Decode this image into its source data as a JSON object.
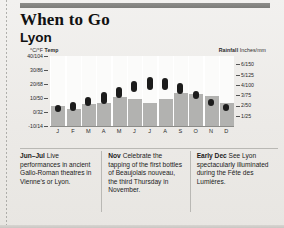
{
  "header": {
    "title": "When to Go",
    "city": "Lyon"
  },
  "chart_data": {
    "type": "bar",
    "subtitle": "Lyon",
    "left_axis_label": "°C/°F Temp",
    "left_axis_label_bold": "Temp",
    "right_axis_label": "Rainfall Inches/mm",
    "right_axis_label_bold": "Rainfall",
    "xlabel": "",
    "categories": [
      "J",
      "F",
      "M",
      "A",
      "M",
      "J",
      "J",
      "A",
      "S",
      "O",
      "N",
      "D"
    ],
    "temp_ticks": [
      "40/104",
      "30/86",
      "20/68",
      "10/50",
      "0/32",
      "-10/14"
    ],
    "temp_tick_values": [
      40,
      30,
      20,
      10,
      0,
      -10
    ],
    "ylim": [
      -10,
      40
    ],
    "rain_ticks": [
      "6/150",
      "5/125",
      "4/100",
      "3/75",
      "2/50",
      "1/25"
    ],
    "rain_tick_values": [
      6,
      5,
      4,
      3,
      2,
      1
    ],
    "rain_ylim": [
      0,
      6.8
    ],
    "grid": false,
    "legend": "none",
    "series": [
      {
        "name": "Temperature range (°C low–high)",
        "type": "range-marker",
        "low": [
          0,
          1,
          4,
          6,
          10,
          14,
          16,
          16,
          13,
          9,
          4,
          1
        ],
        "high": [
          5,
          7,
          11,
          14,
          18,
          22,
          25,
          24,
          21,
          15,
          9,
          6
        ]
      },
      {
        "name": "Rainfall (inches)",
        "type": "bar",
        "values": [
          1.9,
          1.7,
          2.1,
          2.2,
          2.8,
          2.6,
          2.2,
          2.6,
          3.2,
          3.1,
          2.9,
          2.2
        ]
      }
    ]
  },
  "notes": [
    {
      "lead": "Jun–Jul",
      "body": " Live performances in ancient Gallo-Roman theatres in Vienne's or Lyon."
    },
    {
      "lead": "Nov",
      "body": " Celebrate the tapping of the first bottles of Beaujolais nouveau, the third Thursday in November."
    },
    {
      "lead": "Early Dec",
      "body": " See Lyon spectacularly illuminated during the Fête des Lumières."
    }
  ]
}
